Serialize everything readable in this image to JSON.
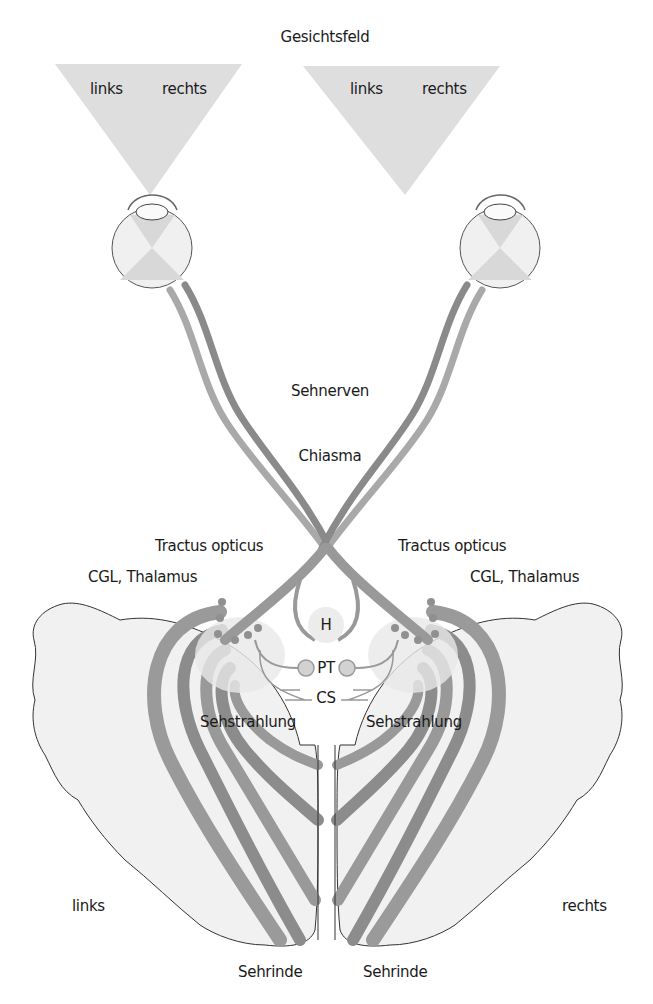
{
  "title": "Gesichtsfeld",
  "visual_fields": [
    {
      "side": "left-eye",
      "left_label": "links",
      "right_label": "rechts"
    },
    {
      "side": "right-eye",
      "left_label": "links",
      "right_label": "rechts"
    }
  ],
  "labels": {
    "optic_nerves": "Sehnerven",
    "chiasm": "Chiasma",
    "optic_tract_left": "Tractus opticus",
    "optic_tract_right": "Tractus opticus",
    "lgn_left": "CGL, Thalamus",
    "lgn_right": "CGL, Thalamus",
    "hypothalamus": "H",
    "pretectum": "PT",
    "superior_colliculus": "CS",
    "radiation_left": "Sehstrahlung",
    "radiation_right": "Sehstrahlung",
    "hemisphere_left": "links",
    "hemisphere_right": "rechts",
    "cortex_left": "Sehrinde",
    "cortex_right": "Sehrinde"
  },
  "colors": {
    "field": "#dcdcdc",
    "pathway_light": "#a8a8a8",
    "pathway_dark": "#8a8a8a",
    "brain_fill": "#f0f0f0",
    "brain_outline": "#333333",
    "nucleus": "#cfcfcf"
  }
}
